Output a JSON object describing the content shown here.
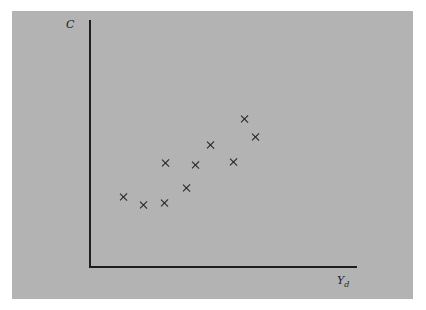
{
  "chart_data": {
    "type": "scatter",
    "title": "",
    "xlabel": "Y_d",
    "ylabel": "C",
    "ylabel_text": "C",
    "xlabel_main": "Y",
    "xlabel_sub": "d",
    "grid": false,
    "legend": null,
    "ticks": "none",
    "points_px": [
      [
        124,
        197
      ],
      [
        144,
        205
      ],
      [
        165,
        203
      ],
      [
        166,
        163
      ],
      [
        187,
        188
      ],
      [
        196,
        165
      ],
      [
        211,
        145
      ],
      [
        234,
        162
      ],
      [
        245,
        119
      ],
      [
        256,
        137
      ]
    ],
    "points_relative": [
      {
        "x": 0.13,
        "y": 0.28
      },
      {
        "x": 0.2,
        "y": 0.25
      },
      {
        "x": 0.28,
        "y": 0.26
      },
      {
        "x": 0.28,
        "y": 0.42
      },
      {
        "x": 0.36,
        "y": 0.32
      },
      {
        "x": 0.4,
        "y": 0.41
      },
      {
        "x": 0.45,
        "y": 0.49
      },
      {
        "x": 0.54,
        "y": 0.42
      },
      {
        "x": 0.58,
        "y": 0.6
      },
      {
        "x": 0.62,
        "y": 0.53
      }
    ],
    "colors": {
      "panel": "#b3b3b3",
      "axis": "#1e1e1e",
      "marker": "#222222"
    }
  }
}
